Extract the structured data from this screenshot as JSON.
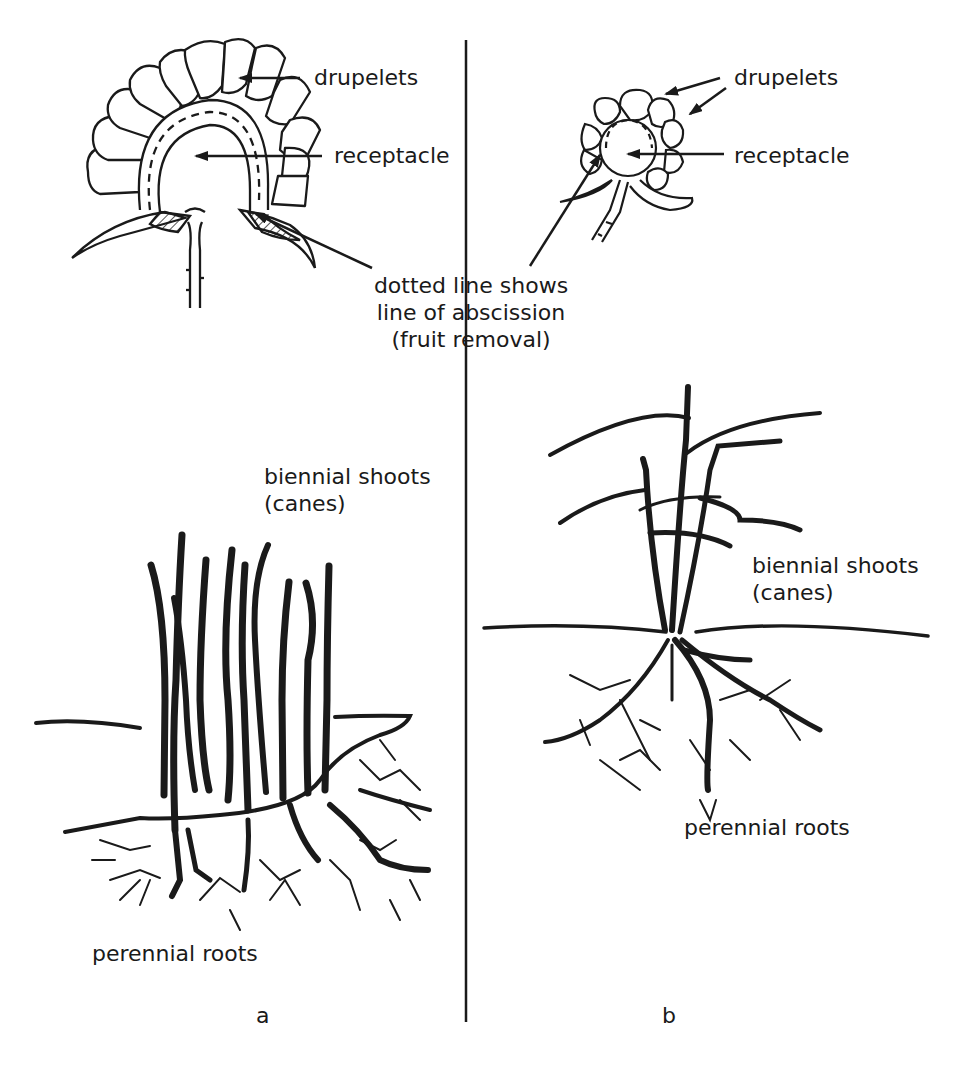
{
  "diagram": {
    "type": "botanical-comparison",
    "divider": {
      "x": 466,
      "y_top": 40,
      "y_bottom": 1022
    },
    "panel_a": {
      "letter": "a",
      "fruit_labels": {
        "drupelets": "drupelets",
        "receptacle": "receptacle"
      },
      "shoots_label": {
        "line1": "biennial shoots",
        "line2": "(canes)"
      },
      "roots_label": "perennial roots"
    },
    "panel_b": {
      "letter": "b",
      "fruit_labels": {
        "drupelets": "drupelets",
        "receptacle": "receptacle"
      },
      "shoots_label": {
        "line1": "biennial shoots",
        "line2": "(canes)"
      },
      "roots_label": "perennial roots"
    },
    "shared_caption": {
      "line1": "dotted line shows",
      "line2": "line of abscission",
      "line3": "(fruit removal)"
    },
    "colors": {
      "ink": "#1a1a1a",
      "background": "#ffffff"
    }
  }
}
